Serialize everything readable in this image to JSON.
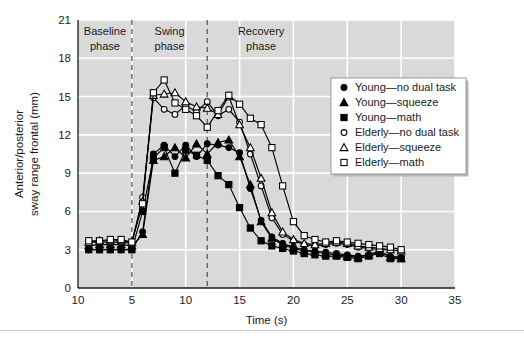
{
  "chart_data": {
    "type": "line",
    "title": "",
    "xlabel": "Time (s)",
    "ylabel": "Anterior/posterior\nsway range frontal (mm)",
    "ylabel_line1": "Anterior/posterior",
    "ylabel_line2": "sway range frontal (mm)",
    "xlim": [
      0,
      35
    ],
    "ylim": [
      0,
      21
    ],
    "xticks": [
      0,
      5,
      10,
      15,
      20,
      25,
      30,
      35
    ],
    "xtick_labels": [
      "10",
      "5",
      "10",
      "15",
      "20",
      "25",
      "30",
      "35"
    ],
    "yticks": [
      0,
      3,
      6,
      9,
      12,
      15,
      18,
      21
    ],
    "ytick_labels": [
      "0",
      "3",
      "6",
      "9",
      "12",
      "15",
      "18",
      "21"
    ],
    "grid": "horizontal-and-vertical-white-on-gray",
    "legend_position": "upper-right-inside",
    "plot_background": "#d9d9d9",
    "gridline_color": "#ffffff",
    "annotations": [
      {
        "text_line1": "Baseline",
        "text_line2": "phase",
        "x_center": 2.5
      },
      {
        "text_line1": "Swing",
        "text_line2": "phase",
        "x_center": 8.5
      },
      {
        "text_line1": "Recovery",
        "text_line2": "phase",
        "x_center": 17.0
      }
    ],
    "phase_dividers": [
      5,
      12
    ],
    "x": [
      1,
      2,
      3,
      4,
      5,
      6,
      7,
      8,
      9,
      10,
      11,
      12,
      13,
      14,
      15,
      16,
      17,
      18,
      19,
      20,
      21,
      22,
      23,
      24,
      25,
      26,
      27,
      28,
      29,
      30
    ],
    "series": [
      {
        "name": "Young—no dual task",
        "marker": "filled-circle",
        "color": "#000000",
        "values": [
          3.0,
          3.0,
          3.0,
          3.0,
          3.0,
          4.4,
          10.5,
          11.2,
          10.3,
          11.2,
          10.3,
          11.3,
          11.2,
          11.0,
          10.6,
          7.8,
          5.3,
          4.0,
          3.5,
          3.2,
          3.0,
          2.9,
          2.8,
          2.7,
          2.6,
          2.5,
          2.6,
          2.8,
          2.5,
          2.4
        ]
      },
      {
        "name": "Young—squeeze",
        "marker": "filled-triangle",
        "color": "#000000",
        "values": [
          3.3,
          3.4,
          3.4,
          3.4,
          3.3,
          4.2,
          10.0,
          10.3,
          11.0,
          10.2,
          11.3,
          10.5,
          11.4,
          11.6,
          10.3,
          8.1,
          5.2,
          3.9,
          3.4,
          3.1,
          2.9,
          2.8,
          2.7,
          2.6,
          2.5,
          2.4,
          2.6,
          2.9,
          2.4,
          2.3
        ]
      },
      {
        "name": "Young—math",
        "marker": "filled-square",
        "color": "#000000",
        "values": [
          3.0,
          3.0,
          3.0,
          3.0,
          3.0,
          6.0,
          10.2,
          11.0,
          9.0,
          10.8,
          10.4,
          10.0,
          8.8,
          8.1,
          6.3,
          4.7,
          3.7,
          3.3,
          3.1,
          2.9,
          2.7,
          2.6,
          2.5,
          2.5,
          2.4,
          2.3,
          2.5,
          2.7,
          2.3,
          2.3
        ]
      },
      {
        "name": "Elderly—no dual task",
        "marker": "open-circle",
        "color": "#000000",
        "values": [
          3.6,
          3.6,
          3.6,
          3.6,
          3.5,
          7.1,
          14.9,
          14.0,
          13.6,
          14.3,
          13.8,
          14.6,
          13.5,
          14.0,
          13.0,
          10.5,
          8.0,
          5.5,
          4.2,
          3.7,
          3.4,
          3.3,
          3.4,
          3.5,
          3.4,
          3.2,
          3.1,
          3.0,
          3.0,
          2.9
        ]
      },
      {
        "name": "Elderly—squeeze",
        "marker": "open-triangle",
        "color": "#000000",
        "values": [
          3.6,
          3.7,
          3.7,
          3.7,
          3.6,
          6.8,
          15.1,
          15.2,
          15.3,
          14.6,
          14.2,
          14.1,
          13.6,
          15.0,
          12.8,
          11.0,
          8.6,
          5.9,
          4.4,
          3.8,
          3.5,
          3.4,
          3.5,
          3.6,
          3.5,
          3.3,
          3.2,
          3.1,
          3.0,
          2.9
        ]
      },
      {
        "name": "Elderly—math",
        "marker": "open-square",
        "color": "#000000",
        "values": [
          3.7,
          3.7,
          3.8,
          3.8,
          3.6,
          6.6,
          15.3,
          16.3,
          14.5,
          14.0,
          13.5,
          12.6,
          13.9,
          15.1,
          14.4,
          13.3,
          12.8,
          11.0,
          8.0,
          5.2,
          4.1,
          3.8,
          3.6,
          3.7,
          3.6,
          3.5,
          3.4,
          3.3,
          3.2,
          3.0
        ]
      }
    ]
  },
  "legend": {
    "items": [
      {
        "label": "Young—no dual task",
        "marker": "filled-circle"
      },
      {
        "label": "Young—squeeze",
        "marker": "filled-triangle"
      },
      {
        "label": "Young—math",
        "marker": "filled-square"
      },
      {
        "label": "Elderly—no dual task",
        "marker": "open-circle"
      },
      {
        "label": "Elderly—squeeze",
        "marker": "open-triangle"
      },
      {
        "label": "Elderly—math",
        "marker": "open-square"
      }
    ]
  }
}
